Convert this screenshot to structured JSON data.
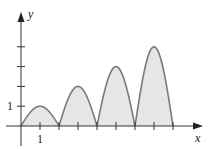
{
  "chart_data": {
    "type": "area",
    "title": "",
    "xlabel": "x",
    "ylabel": "y",
    "x_tick_labels": [
      {
        "value": 1,
        "label": "1"
      }
    ],
    "y_tick_labels": [
      {
        "value": 1,
        "label": "1"
      }
    ],
    "x_ticks": [
      1,
      2,
      3,
      4,
      5,
      6,
      7,
      8
    ],
    "y_ticks": [
      1,
      2,
      3,
      4
    ],
    "xlim": [
      0,
      9.5
    ],
    "ylim": [
      0,
      5
    ],
    "grid": false,
    "series": [
      {
        "name": "arch-1",
        "x_start": 0,
        "x_end": 2,
        "peak_x": 1,
        "peak_y": 1
      },
      {
        "name": "arch-2",
        "x_start": 2,
        "x_end": 4,
        "peak_x": 3,
        "peak_y": 2
      },
      {
        "name": "arch-3",
        "x_start": 4,
        "x_end": 6,
        "peak_x": 5,
        "peak_y": 3
      },
      {
        "name": "arch-4",
        "x_start": 6,
        "x_end": 8,
        "peak_x": 7,
        "peak_y": 4
      }
    ],
    "fill_color": "#e6e6e6",
    "curve_color": "#7a7a7a",
    "axis_color": "#333333"
  },
  "labels": {
    "x_axis": "x",
    "y_axis": "y",
    "x_one": "1",
    "y_one": "1"
  }
}
